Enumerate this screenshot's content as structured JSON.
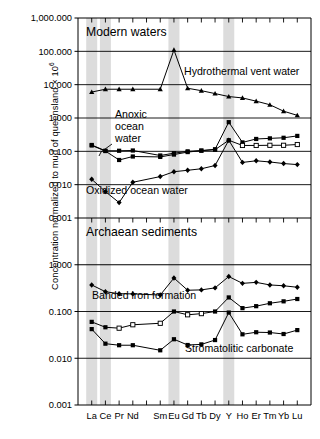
{
  "figure": {
    "ylabel_main": "Concentration normalized to mud of queensland × 10",
    "ylabel_exponent": "6"
  },
  "chart_data": {
    "type": "line",
    "title": "",
    "xlabel": "",
    "ylabel": "Concentration normalized to mud of queensland × 10⁶",
    "grid": true,
    "legend": "inline annotations",
    "x_categories": [
      "La",
      "Ce",
      "Pr",
      "Nd",
      "Pm",
      "Sm",
      "Eu",
      "Gd",
      "Tb",
      "Dy",
      "Y",
      "Ho",
      "Er",
      "Tm",
      "Yb",
      "Lu"
    ],
    "x_tick_labels": [
      "La",
      "Ce",
      "Pr",
      "Nd",
      "",
      "Sm",
      "Eu",
      "Gd",
      "Tb",
      "Dy",
      "Y",
      "Ho",
      "Er",
      "Tm",
      "Yb",
      "Lu"
    ],
    "highlight_bands": [
      "La",
      "Ce",
      "Eu",
      "Y"
    ],
    "panels": [
      {
        "id": "modern-waters",
        "label": "Modern waters",
        "yscale": "log",
        "ylim": [
          0.001,
          1000
        ],
        "ytick_labels": [
          "1,000.000",
          "100.000",
          "10.000",
          "1.000",
          "0.100",
          "0.010",
          "0.001"
        ],
        "ytick_values": [
          1000,
          100,
          10,
          1,
          0.1,
          0.01,
          0.001
        ],
        "series": [
          {
            "name": "Hydrothermal vent water",
            "marker": "triangle",
            "x": [
              "La",
              "Ce",
              "Pr",
              "Nd",
              "Sm",
              "Eu",
              "Gd",
              "Tb",
              "Dy",
              "Y",
              "Ho",
              "Er",
              "Tm",
              "Yb",
              "Lu"
            ],
            "values": [
              6.0,
              7.3,
              7.3,
              7.3,
              7.3,
              110.0,
              7.8,
              6.6,
              5.4,
              4.4,
              4.0,
              3.2,
              2.5,
              1.6,
              1.2
            ]
          },
          {
            "name": "Anoxic ocean water",
            "marker": "square",
            "x": [
              "La",
              "Ce",
              "Pr",
              "Nd",
              "Sm",
              "Eu",
              "Gd",
              "Tb",
              "Dy",
              "Y",
              "Ho",
              "Er",
              "Tm",
              "Yb",
              "Lu"
            ],
            "values": [
              0.155,
              0.104,
              0.104,
              0.106,
              0.075,
              0.088,
              0.1,
              0.105,
              0.115,
              0.75,
              0.185,
              0.235,
              0.245,
              0.255,
              0.29
            ]
          },
          {
            "name": "Anoxic ocean water secondary",
            "marker": "square",
            "x": [
              "La",
              "Ce",
              "Pr",
              "Nd",
              "Sm",
              "Eu",
              "Gd",
              "Tb",
              "Dy",
              "Y",
              "Ho",
              "Er",
              "Tm",
              "Yb",
              "Lu"
            ],
            "values": [
              0.15,
              0.102,
              0.055,
              0.07,
              0.068,
              0.08,
              0.095,
              0.105,
              0.112,
              0.215,
              0.15,
              0.15,
              0.152,
              0.152,
              0.16
            ]
          },
          {
            "name": "Oxidized ocean water",
            "marker": "diamond",
            "x": [
              "La",
              "Ce",
              "Pr",
              "Nd",
              "Sm",
              "Eu",
              "Gd",
              "Tb",
              "Dy",
              "Y",
              "Ho",
              "Er",
              "Tm",
              "Yb",
              "Lu"
            ],
            "values": [
              0.0145,
              0.0062,
              0.0029,
              0.0118,
              0.0175,
              0.0245,
              0.027,
              0.03,
              0.0375,
              0.215,
              0.0465,
              0.052,
              0.048,
              0.043,
              0.04
            ]
          }
        ],
        "annotations": [
          {
            "text": "Hydrothermal vent water"
          },
          {
            "text": "Anoxic"
          },
          {
            "text": "ocean"
          },
          {
            "text": "water"
          },
          {
            "text": "Oxidized ocean water"
          }
        ]
      },
      {
        "id": "archaean-sediments",
        "label": "Archaean sediments",
        "yscale": "log",
        "ylim": [
          0.001,
          10
        ],
        "ytick_labels": [
          "1.000",
          "0.100",
          "0.010",
          "0.001"
        ],
        "ytick_values": [
          1,
          0.1,
          0.01,
          0.001
        ],
        "series": [
          {
            "name": "Banded iron formation",
            "marker": "diamond",
            "x": [
              "La",
              "Ce",
              "Pr",
              "Nd",
              "Sm",
              "Eu",
              "Gd",
              "Tb",
              "Dy",
              "Y",
              "Ho",
              "Er",
              "Tm",
              "Yb",
              "Lu"
            ],
            "values": [
              0.37,
              0.265,
              0.24,
              0.238,
              0.225,
              0.52,
              0.285,
              0.29,
              0.32,
              0.56,
              0.4,
              0.42,
              0.37,
              0.355,
              0.33
            ]
          },
          {
            "name": "Banded iron formation lower",
            "marker": "square",
            "x": [
              "La",
              "Ce",
              "Pr",
              "Nd",
              "Sm",
              "Eu",
              "Gd",
              "Tb",
              "Dy",
              "Y",
              "Ho",
              "Er",
              "Tm",
              "Yb",
              "Lu"
            ],
            "values": [
              0.06,
              0.046,
              0.044,
              0.052,
              0.056,
              0.1,
              0.085,
              0.09,
              0.1,
              0.2,
              0.118,
              0.13,
              0.15,
              0.165,
              0.185
            ]
          },
          {
            "name": "Stromatolitic carbonate",
            "marker": "square",
            "x": [
              "La",
              "Ce",
              "Pr",
              "Nd",
              "Sm",
              "Eu",
              "Gd",
              "Tb",
              "Dy",
              "Y",
              "Ho",
              "Er",
              "Tm",
              "Yb",
              "Lu"
            ],
            "values": [
              0.042,
              0.0205,
              0.019,
              0.019,
              0.0148,
              0.0255,
              0.0192,
              0.0198,
              0.0245,
              0.095,
              0.0325,
              0.036,
              0.0355,
              0.033,
              0.04
            ]
          }
        ],
        "annotations": [
          {
            "text": "Banded iron formation"
          },
          {
            "text": "Stromatolitic carbonate"
          }
        ]
      }
    ]
  }
}
